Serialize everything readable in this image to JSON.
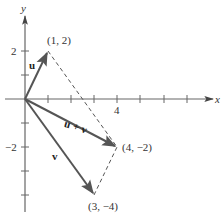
{
  "diagram": {
    "axes": {
      "x_label": "x",
      "y_label": "y",
      "x_ticks": [
        1,
        2,
        3,
        4,
        5,
        6,
        7
      ],
      "y_ticks": [
        2,
        1,
        -1,
        -2,
        -3,
        -4
      ],
      "x_tick_labels": [
        {
          "value": 4,
          "text": "4"
        }
      ],
      "y_tick_labels": [
        {
          "value": 2,
          "text": "2"
        },
        {
          "value": -2,
          "text": "−2"
        }
      ]
    },
    "vectors": [
      {
        "name": "u",
        "label": "u",
        "from": [
          0,
          0
        ],
        "to": [
          1,
          2
        ],
        "style": "solid"
      },
      {
        "name": "v",
        "label": "v",
        "from": [
          0,
          0
        ],
        "to": [
          3,
          -4
        ],
        "style": "solid"
      },
      {
        "name": "u_plus_v",
        "label": "u + v",
        "from": [
          0,
          0
        ],
        "to": [
          4,
          -2
        ],
        "style": "solid"
      }
    ],
    "dashed_edges": [
      {
        "from": [
          1,
          2
        ],
        "to": [
          4,
          -2
        ]
      },
      {
        "from": [
          3,
          -4
        ],
        "to": [
          4,
          -2
        ]
      }
    ],
    "points": [
      {
        "coords": [
          1,
          2
        ],
        "label": "(1, 2)"
      },
      {
        "coords": [
          4,
          -2
        ],
        "label": "(4, −2)"
      },
      {
        "coords": [
          3,
          -4
        ],
        "label": "(3, −4)"
      }
    ],
    "colors": {
      "axis": "#555555",
      "vector": "#555555",
      "dashed": "#555555",
      "text": "#333333"
    },
    "labels": {
      "x_axis": "x",
      "y_axis": "y",
      "tick_4": "4",
      "tick_2": "2",
      "tick_neg2": "−2",
      "point_1_2": "(1, 2)",
      "point_4_neg2": "(4, −2)",
      "point_3_neg4": "(3, −4)",
      "vec_u": "u",
      "vec_v": "v",
      "vec_u_plus_v": "u + v"
    }
  }
}
